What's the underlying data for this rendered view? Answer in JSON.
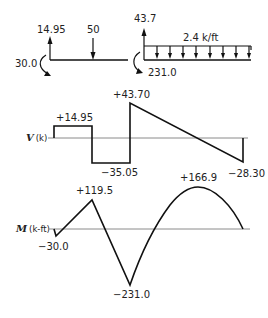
{
  "free_body_left": {
    "reaction_up": "14.95",
    "point_load": "50",
    "moment": "30.0"
  },
  "free_body_right": {
    "reaction_up": "43.7",
    "distributed_load": "2.4 k/ft",
    "moment": "231.0"
  },
  "shear_diagram": {
    "axis_label_symbol": "V",
    "axis_label_unit": "(k)",
    "values": {
      "v1": "+14.95",
      "v2": "−35.05",
      "v3": "+43.70",
      "v4": "−28.30"
    }
  },
  "moment_diagram": {
    "axis_label_symbol": "M",
    "axis_label_unit": "(k-ft)",
    "values": {
      "m1": "−30.0",
      "m2": "+119.5",
      "m3": "−231.0",
      "m4": "+166.9"
    }
  },
  "colors": {
    "line": "#111111",
    "axis": "#8a8a8a",
    "background": "#ffffff"
  }
}
